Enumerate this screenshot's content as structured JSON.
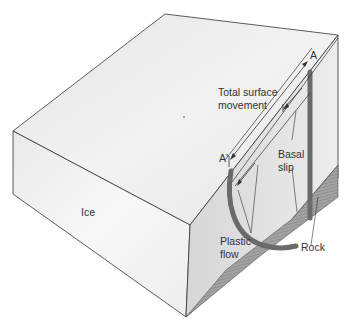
{
  "diagram": {
    "type": "glacier-flow-block-diagram",
    "labels": {
      "point_a": "A",
      "point_a_prime": "A'",
      "total_surface_movement_line1": "Total surface",
      "total_surface_movement_line2": "movement",
      "basal_slip_line1": "Basal",
      "basal_slip_line2": "slip",
      "plastic_flow_line1": "Plastic",
      "plastic_flow_line2": "flow",
      "ice": "Ice",
      "rock": "Rock"
    },
    "colors": {
      "top_face": "#ededed",
      "front_face": "#f4f4f4",
      "side_face": "#e2e2e2",
      "rock": "#9a9a9a",
      "rod": "#6f6f6f",
      "outline": "#333333",
      "text": "#333333"
    }
  }
}
